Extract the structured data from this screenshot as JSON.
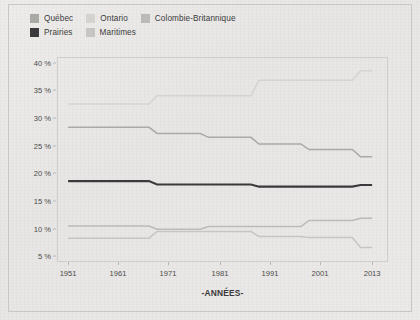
{
  "legend": {
    "rows": [
      [
        {
          "label": "Québec",
          "color": "#a9a9a6"
        },
        {
          "label": "Ontario",
          "color": "#d4d3d0"
        },
        {
          "label": "Colombie-Britannique",
          "color": "#bbbab7"
        }
      ],
      [
        {
          "label": "Prairies",
          "color": "#3a3a3c"
        },
        {
          "label": "Maritimes",
          "color": "#c6c5c2"
        }
      ]
    ]
  },
  "axis": {
    "x_title": "-ANNÉES-",
    "y_ticks": [
      "40 %",
      "35 %",
      "30 %",
      "25 %",
      "20 %",
      "15 %",
      "10 %",
      "5 %"
    ],
    "x_ticks": [
      "1951",
      "1961",
      "1971",
      "1981",
      "1991",
      "2001",
      "2013"
    ]
  },
  "chart_data": {
    "type": "line",
    "title": "",
    "subtitle": "",
    "xlabel": "-ANNÉES-",
    "ylabel": "",
    "step": true,
    "grid": false,
    "legend_position": "top-left",
    "xlim": [
      1951,
      2013
    ],
    "ylim": [
      4,
      41
    ],
    "x": [
      1951,
      1961,
      1971,
      1981,
      1991,
      2001,
      2013
    ],
    "categories": [
      "1951",
      "1961",
      "1971",
      "1981",
      "1991",
      "2001",
      "2013"
    ],
    "series": [
      {
        "name": "Ontario",
        "color": "#d4d3d0",
        "values": [
          32.5,
          32.5,
          34.0,
          34.0,
          36.8,
          36.8,
          38.5
        ]
      },
      {
        "name": "Québec",
        "color": "#a9a9a6",
        "values": [
          28.3,
          28.3,
          27.2,
          26.5,
          25.3,
          24.3,
          23.0
        ]
      },
      {
        "name": "Prairies",
        "color": "#3a3a3c",
        "values": [
          18.6,
          18.6,
          18.0,
          18.0,
          17.6,
          17.6,
          17.9
        ]
      },
      {
        "name": "Colombie-Britannique",
        "color": "#bbbab7",
        "values": [
          10.5,
          10.5,
          9.9,
          10.4,
          10.4,
          11.5,
          11.9
        ]
      },
      {
        "name": "Maritimes",
        "color": "#c6c5c2",
        "values": [
          8.3,
          8.3,
          9.5,
          9.5,
          8.6,
          8.4,
          6.6
        ]
      }
    ]
  }
}
